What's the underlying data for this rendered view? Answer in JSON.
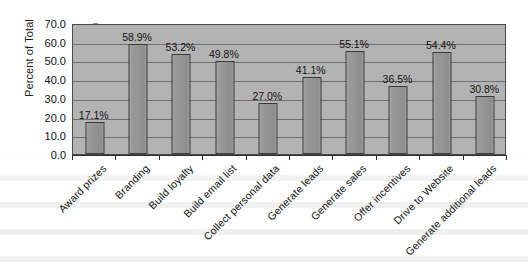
{
  "chart_data": {
    "type": "bar",
    "title": "",
    "xlabel": "",
    "ylabel": "Percent of Total",
    "ylim": [
      0,
      70
    ],
    "ytick_step": 10,
    "grid": true,
    "legend": false,
    "value_label_suffix": "%",
    "yticks": [
      "70.0",
      "60.0",
      "50.0",
      "40.0",
      "30.0",
      "20.0",
      "10.0",
      "0.0"
    ],
    "ytick_values": [
      70,
      60,
      50,
      40,
      30,
      20,
      10,
      0
    ],
    "categories": [
      "Award prizes",
      "Branding",
      "Build loyalty",
      "Build email list",
      "Collect personal data",
      "Generate leads",
      "Generate sales",
      "Offer incentives",
      "Drive to Website",
      "Generate additional leads"
    ],
    "values": [
      17.1,
      58.9,
      53.2,
      49.8,
      27.0,
      41.1,
      55.1,
      36.5,
      54.4,
      30.8
    ],
    "value_labels": [
      "17.1%",
      "58.9%",
      "53.2%",
      "49.8%",
      "27.0%",
      "41.1%",
      "55.1%",
      "36.5%",
      "54.4%",
      "30.8%"
    ]
  },
  "style": {
    "plot_background": "#b3b3b3",
    "bar_fill": "#969696",
    "bar_border": "#3a3a3a",
    "gridline_color": "#6e6e6e",
    "axis_color": "#2b2b2b",
    "text_color": "#111111",
    "page_background": "#ffffff"
  }
}
